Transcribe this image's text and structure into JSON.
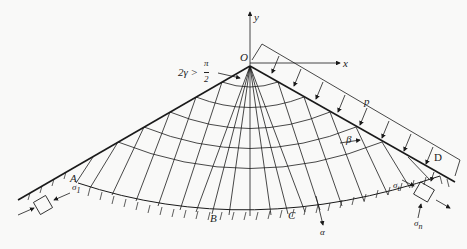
{
  "diagram": {
    "type": "slip-line field under wedge with distributed load",
    "labels": {
      "origin": "O",
      "x_axis": "x",
      "y_axis": "y",
      "angle": "2γ >",
      "angle_num": "π",
      "angle_den": "2",
      "load": "p",
      "beta": "β",
      "alpha": "α",
      "point_A": "A",
      "point_B": "B",
      "point_C": "C",
      "point_D": "D",
      "sigma_left": "σ",
      "sigma_left_sub": "1",
      "sigma_right_t": "σ",
      "sigma_right_t_sub": "t",
      "sigma_right_n": "σ",
      "sigma_right_n_sub": "n"
    },
    "colors": {
      "line": "#1a1a1a",
      "background": "#f9f9f8"
    }
  }
}
